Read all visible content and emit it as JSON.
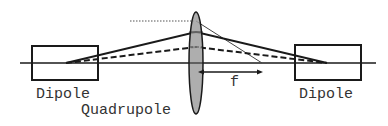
{
  "diagram": {
    "type": "beam optics schematic",
    "labels": {
      "left_element": "Dipole",
      "center_element": "Quadrupole",
      "right_element": "Dipole",
      "focal_length": "f"
    },
    "colors": {
      "line": "#1a1a1a",
      "lens_fill": "#a0a0a0",
      "text": "#333333"
    },
    "elements": [
      {
        "id": "left-dipole",
        "shape": "rectangle",
        "label": "Dipole"
      },
      {
        "id": "quadrupole-lens",
        "shape": "ellipse",
        "label": "Quadrupole"
      },
      {
        "id": "right-dipole",
        "shape": "rectangle",
        "label": "Dipole"
      }
    ],
    "rays": [
      {
        "id": "solid-ray",
        "style": "solid"
      },
      {
        "id": "dashed-ray",
        "style": "dashed"
      },
      {
        "id": "dotted-parallel-ray",
        "style": "dotted, focusing to focal point"
      }
    ],
    "annotations": [
      {
        "id": "focal-length-arrow",
        "label": "f"
      }
    ]
  }
}
